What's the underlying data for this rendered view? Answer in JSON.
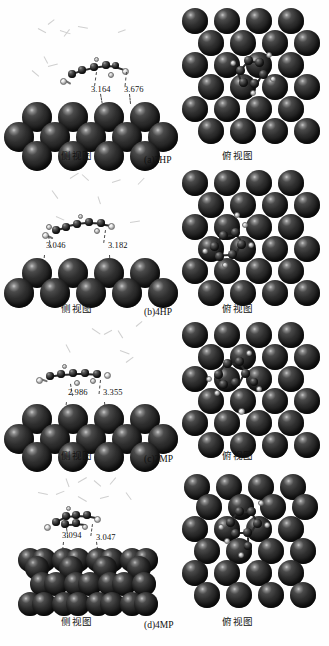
{
  "figure": {
    "kind": "molecular-adsorption-configuration-figure",
    "view_labels": {
      "side": "侧视图",
      "top": "俯视图"
    },
    "units_note": "",
    "colors": {
      "metal_atom": "#2f2f2f",
      "carbon_atom": "#262626",
      "hydrogen_atom": "#f2f2f2",
      "background": "#ffffff",
      "text": "#111111"
    }
  },
  "panels": [
    {
      "id": "a",
      "label": "(a)2HP",
      "molecule": "2HP",
      "side_label": "侧视图",
      "top_label": "俯视图",
      "distances": [
        "3.164",
        "3.676"
      ]
    },
    {
      "id": "b",
      "label": "(b)4HP",
      "molecule": "4HP",
      "side_label": "侧视图",
      "top_label": "俯视图",
      "distances": [
        "3.046",
        "3.182"
      ]
    },
    {
      "id": "c",
      "label": "(c)2MP",
      "molecule": "2MP",
      "side_label": "侧视图",
      "top_label": "俯视图",
      "distances": [
        "2.986",
        "3.355"
      ]
    },
    {
      "id": "d",
      "label": "(d)4MP",
      "molecule": "4MP",
      "side_label": "侧视图",
      "top_label": "俯视图",
      "distances": [
        "3.094",
        "3.047"
      ]
    }
  ]
}
